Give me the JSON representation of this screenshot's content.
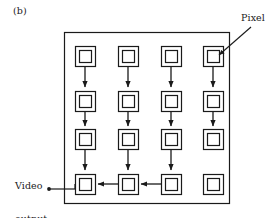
{
  "figure": {
    "panel_label": "(b)",
    "annotations": {
      "pixel_label": "Pixel",
      "video_output_label_line1": "Video",
      "video_output_label_line2": "output"
    },
    "colors": {
      "stroke": "#1a1a1a",
      "background": "#ffffff",
      "text": "#1a1a1a"
    },
    "array": {
      "rows": 4,
      "columns": 4,
      "pixel_count": 16,
      "pixel_shape": "double-square",
      "container": {
        "x": 64,
        "y": 32,
        "width": 166,
        "height": 172
      }
    },
    "pixels": [
      {
        "id": "pixel-r1c1",
        "row": 1,
        "col": 1,
        "cx": 85,
        "cy": 56
      },
      {
        "id": "pixel-r1c2",
        "row": 1,
        "col": 2,
        "cx": 128,
        "cy": 56
      },
      {
        "id": "pixel-r1c3",
        "row": 1,
        "col": 3,
        "cx": 171,
        "cy": 56
      },
      {
        "id": "pixel-r1c4",
        "row": 1,
        "col": 4,
        "cx": 213,
        "cy": 56
      },
      {
        "id": "pixel-r2c1",
        "row": 2,
        "col": 1,
        "cx": 85,
        "cy": 101
      },
      {
        "id": "pixel-r2c2",
        "row": 2,
        "col": 2,
        "cx": 128,
        "cy": 101
      },
      {
        "id": "pixel-r2c3",
        "row": 2,
        "col": 3,
        "cx": 171,
        "cy": 101
      },
      {
        "id": "pixel-r2c4",
        "row": 2,
        "col": 4,
        "cx": 213,
        "cy": 101
      },
      {
        "id": "pixel-r3c1",
        "row": 3,
        "col": 1,
        "cx": 85,
        "cy": 139
      },
      {
        "id": "pixel-r3c2",
        "row": 3,
        "col": 2,
        "cx": 128,
        "cy": 139
      },
      {
        "id": "pixel-r3c3",
        "row": 3,
        "col": 3,
        "cx": 171,
        "cy": 139
      },
      {
        "id": "pixel-r3c4",
        "row": 3,
        "col": 4,
        "cx": 213,
        "cy": 139
      },
      {
        "id": "pixel-r4c1",
        "row": 4,
        "col": 1,
        "cx": 85,
        "cy": 184
      },
      {
        "id": "pixel-r4c2",
        "row": 4,
        "col": 2,
        "cx": 128,
        "cy": 184
      },
      {
        "id": "pixel-r4c3",
        "row": 4,
        "col": 3,
        "cx": 171,
        "cy": 184
      },
      {
        "id": "pixel-r4c4",
        "row": 4,
        "col": 4,
        "cx": 213,
        "cy": 184
      }
    ],
    "connections": {
      "vertical_transfers": [
        "c1-r1-to-r2",
        "c1-r2-to-r3",
        "c1-r3-to-r4",
        "c2-r1-to-r2",
        "c2-r2-to-r3",
        "c2-r3-to-r4",
        "c3-r1-to-r2",
        "c3-r2-to-r3",
        "c3-r3-to-r4",
        "c4-r1-to-r2",
        "c4-r2-to-r3"
      ],
      "horizontal_transfers": [
        "r4-c3-to-c2",
        "r4-c2-to-c1"
      ],
      "output_line": "r4-c1-to-video-output"
    }
  }
}
